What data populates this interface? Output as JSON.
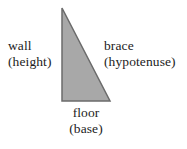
{
  "figure": {
    "background_color": "#ffffff",
    "shape": {
      "name": "right-triangle",
      "fill_color": "#a8a8a8",
      "stroke_color": "#6b6b6b",
      "stroke_width": 1.5,
      "vertices": {
        "apex": [
          62,
          8
        ],
        "bottom_left": [
          62,
          101
        ],
        "bottom_right": [
          110,
          101
        ]
      },
      "points_attr": "62,8 62,101 110,101"
    },
    "labels": {
      "left": {
        "name": "wall",
        "line1": "wall",
        "line2": "(height)"
      },
      "right": {
        "name": "brace",
        "line1": "brace",
        "line2": "(hypotenuse)"
      },
      "bottom": {
        "name": "floor",
        "line1": "floor",
        "line2": "(base)"
      }
    }
  }
}
